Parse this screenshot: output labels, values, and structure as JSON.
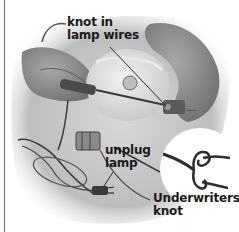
{
  "figure": {
    "style": "grayscale instructional photo illustration",
    "labels": [
      {
        "id": "knot-in-lamp-wires",
        "line1": "knot in",
        "line2": "lamp wires"
      },
      {
        "id": "unplug-lamp",
        "line1": "unplug",
        "line2": "lamp"
      },
      {
        "id": "underwriters-knot",
        "line1": "Underwriters",
        "line2": "knot"
      }
    ],
    "inset": {
      "shape": "circle",
      "content": "Underwriters knot tied in two-conductor wire"
    },
    "colors": {
      "background": "#ffffff",
      "label_text": "#1a1a1a",
      "border_line": "#6e6e6e",
      "mid_gray": "#9a9a9a",
      "dark_gray": "#3a3a3a"
    }
  }
}
